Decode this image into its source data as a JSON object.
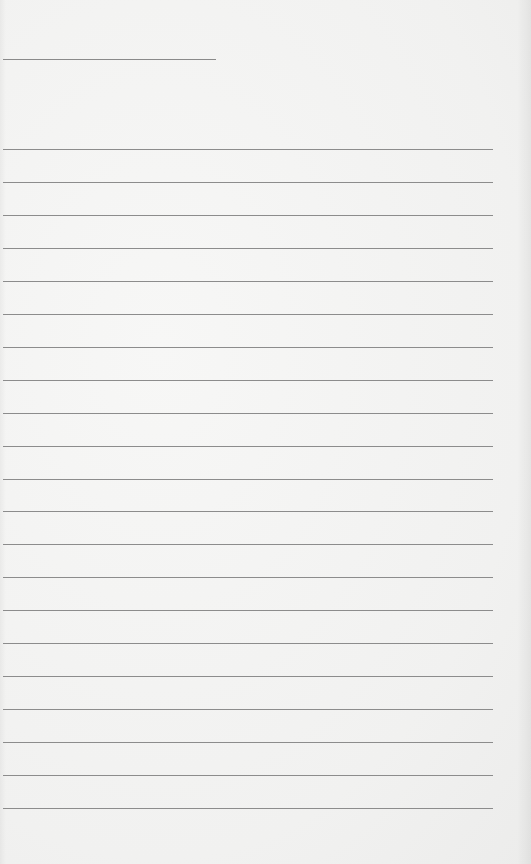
{
  "page": {
    "type": "blank lined paper",
    "background_color": "#f3f3f2",
    "line_color": "#8c8c8c"
  },
  "header_line": {
    "x": 3,
    "y": 59,
    "width": 213
  },
  "ruled_lines": {
    "count": 21,
    "x": 3,
    "width": 490,
    "first_y": 149,
    "spacing": 32.95
  }
}
